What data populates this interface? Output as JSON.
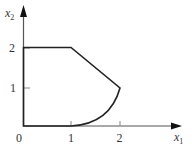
{
  "diagram": {
    "type": "feasible-region",
    "x_axis": {
      "label": "x",
      "subscript": "1",
      "ticks": [
        "1",
        "2"
      ]
    },
    "y_axis": {
      "label": "x",
      "subscript": "2",
      "ticks": [
        "1",
        "2"
      ]
    },
    "origin_label": "0",
    "region_boundary": [
      {
        "from": [
          0,
          0
        ],
        "to": [
          0,
          2
        ],
        "kind": "line"
      },
      {
        "from": [
          0,
          2
        ],
        "to": [
          1,
          2
        ],
        "kind": "line"
      },
      {
        "from": [
          1,
          2
        ],
        "to": [
          2,
          1
        ],
        "kind": "line"
      },
      {
        "from": [
          2,
          1
        ],
        "to": [
          1,
          0
        ],
        "kind": "curve"
      },
      {
        "from": [
          1,
          0
        ],
        "to": [
          0,
          0
        ],
        "kind": "line"
      }
    ],
    "colors": {
      "stroke": "#222222",
      "axis": "#555555"
    }
  }
}
